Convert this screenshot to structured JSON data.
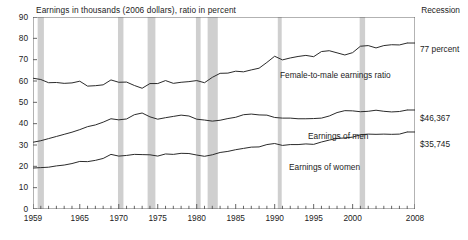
{
  "header": {
    "subtitle": "Earnings in thousands (2006 dollars), ratio in percent",
    "recession_legend": "Recession"
  },
  "right_labels": {
    "ratio": "77 percent",
    "men": "$46,367",
    "women": "$35,745"
  },
  "series_labels": {
    "ratio": "Female-to-male earnings ratio",
    "men": "Earnings of men",
    "women": "Earnings of women"
  },
  "colors": {
    "line": "#2b2b2b",
    "axis": "#555555",
    "recession_band": "#cfcfcf",
    "text": "#1c1c1c",
    "background": "#ffffff"
  },
  "chart_data": {
    "type": "line",
    "title": "",
    "subtitle": "Earnings in thousands (2006 dollars), ratio in percent",
    "xlabel": "",
    "ylabel": "",
    "xlim": [
      1959,
      2008
    ],
    "ylim": [
      0,
      90
    ],
    "yticks": [
      0,
      10,
      20,
      30,
      40,
      50,
      60,
      70,
      80,
      90
    ],
    "xticks": [
      1959,
      1965,
      1970,
      1975,
      1980,
      1985,
      1990,
      1995,
      2000,
      2008
    ],
    "xtick_labels": [
      "1959",
      "1965",
      "1970",
      "1975",
      "1980",
      "1985",
      "1990",
      "1995",
      "2000",
      "2008"
    ],
    "grid": false,
    "legend": "inline-annotations",
    "minor_tick_interval": 1,
    "x": [
      1959,
      1960,
      1961,
      1962,
      1963,
      1964,
      1965,
      1966,
      1967,
      1968,
      1969,
      1970,
      1971,
      1972,
      1973,
      1974,
      1975,
      1976,
      1977,
      1978,
      1979,
      1980,
      1981,
      1982,
      1983,
      1984,
      1985,
      1986,
      1987,
      1988,
      1989,
      1990,
      1991,
      1992,
      1993,
      1994,
      1995,
      1996,
      1997,
      1998,
      1999,
      2000,
      2001,
      2002,
      2003,
      2004,
      2005,
      2006,
      2007
    ],
    "series": [
      {
        "name": "Female-to-male earnings ratio",
        "unit": "percent",
        "end_label": "77 percent",
        "values": [
          61.3,
          60.7,
          59.2,
          59.3,
          58.9,
          59.1,
          59.9,
          57.6,
          57.8,
          58.2,
          60.5,
          59.4,
          59.5,
          57.9,
          56.6,
          58.8,
          58.8,
          60.2,
          58.9,
          59.4,
          59.7,
          60.2,
          59.2,
          61.7,
          63.6,
          63.7,
          64.6,
          64.3,
          65.2,
          66.0,
          68.7,
          71.6,
          69.9,
          70.8,
          71.5,
          72.0,
          71.4,
          73.8,
          74.2,
          73.2,
          72.2,
          73.3,
          76.3,
          76.6,
          75.5,
          76.6,
          77.0,
          76.9,
          77.8
        ]
      },
      {
        "name": "Earnings of men",
        "unit": "thousands of 2006 dollars",
        "end_label": "$46,367",
        "values": [
          31.3,
          32.0,
          33.0,
          34.0,
          35.0,
          36.0,
          37.2,
          38.6,
          39.4,
          40.7,
          42.3,
          41.8,
          42.2,
          44.2,
          45.0,
          43.2,
          42.1,
          42.8,
          43.4,
          44.0,
          43.6,
          42.1,
          41.7,
          41.2,
          41.6,
          42.4,
          43.0,
          44.2,
          44.5,
          44.1,
          44.0,
          42.9,
          42.6,
          42.6,
          42.3,
          42.3,
          42.4,
          42.6,
          43.6,
          45.2,
          46.1,
          46.0,
          45.6,
          45.8,
          46.3,
          45.8,
          45.5,
          45.7,
          46.4
        ]
      },
      {
        "name": "Earnings of women",
        "unit": "thousands of 2006 dollars",
        "end_label": "$35,745",
        "values": [
          19.2,
          19.4,
          19.6,
          20.2,
          20.6,
          21.3,
          22.3,
          22.2,
          22.8,
          23.7,
          25.6,
          24.8,
          25.1,
          25.6,
          25.5,
          25.4,
          24.8,
          25.8,
          25.6,
          26.1,
          26.0,
          25.3,
          24.7,
          25.4,
          26.5,
          27.0,
          27.8,
          28.4,
          29.0,
          29.1,
          30.2,
          30.7,
          29.8,
          30.2,
          30.2,
          30.5,
          30.3,
          31.4,
          32.3,
          33.1,
          33.3,
          33.7,
          34.8,
          35.1,
          35.0,
          35.1,
          35.0,
          35.1,
          36.1
        ]
      }
    ],
    "recession_bands": [
      {
        "start": 1959.6,
        "end": 1960.4
      },
      {
        "start": 1969.9,
        "end": 1970.6
      },
      {
        "start": 1973.7,
        "end": 1974.7
      },
      {
        "start": 1979.9,
        "end": 1980.5
      },
      {
        "start": 1981.4,
        "end": 1982.7
      },
      {
        "start": 1990.4,
        "end": 1990.9
      },
      {
        "start": 2000.9,
        "end": 2001.6
      }
    ]
  }
}
